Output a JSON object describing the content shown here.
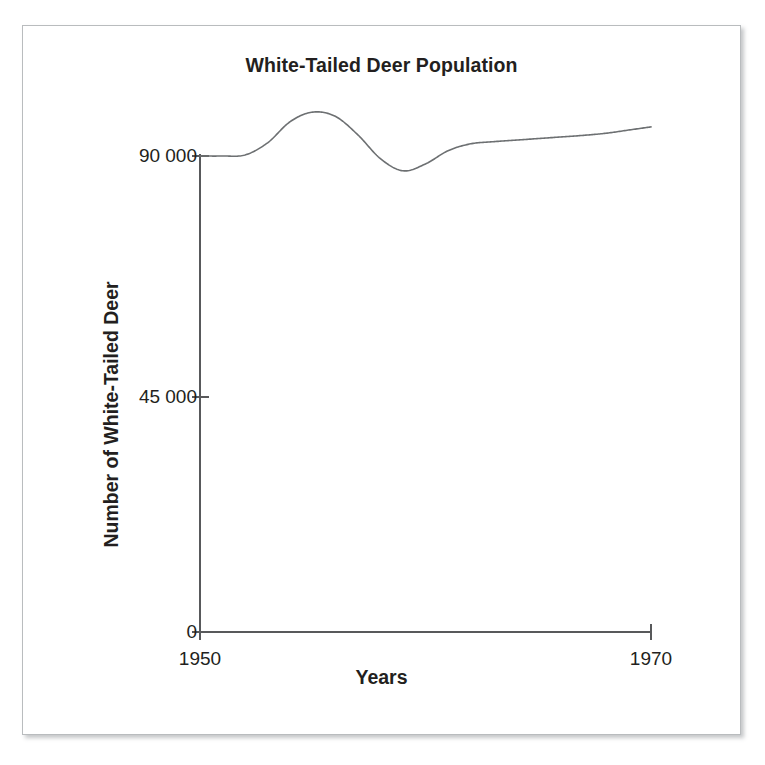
{
  "figure": {
    "frame_color": "#b9bcbe",
    "background": "#ffffff"
  },
  "chart_data": {
    "type": "line",
    "title": "White-Tailed Deer Population",
    "xlabel": "Years",
    "ylabel": "Number of White-Tailed Deer",
    "x": [
      1950,
      1951,
      1952,
      1953,
      1954,
      1955,
      1956,
      1957,
      1958,
      1959,
      1960,
      1961,
      1962,
      1963,
      1964,
      1965,
      1966,
      1967,
      1968,
      1969,
      1970
    ],
    "values": [
      90000,
      90000,
      90200,
      92500,
      96500,
      98300,
      97500,
      94000,
      89500,
      87200,
      88500,
      91000,
      92300,
      92700,
      93000,
      93300,
      93600,
      93900,
      94300,
      94900,
      95500
    ],
    "series": [
      {
        "name": "White-Tailed Deer Population",
        "values": [
          90000,
          90000,
          90200,
          92500,
          96500,
          98300,
          97500,
          94000,
          89500,
          87200,
          88500,
          91000,
          92300,
          92700,
          93000,
          93300,
          93600,
          93900,
          94300,
          94900,
          95500
        ]
      }
    ],
    "xlim": [
      1950,
      1970
    ],
    "ylim": [
      0,
      112500
    ],
    "x_ticks": [
      1950,
      1970
    ],
    "x_tick_labels": [
      "1950",
      "1970"
    ],
    "y_ticks": [
      0,
      45000,
      90000
    ],
    "y_tick_labels": [
      "0",
      "45 000",
      "90 000"
    ],
    "grid": false,
    "legend": false,
    "line_color": "#6d7072",
    "line_width": 1.6,
    "axis_color": "#58595b"
  },
  "axis_labels": {
    "y_90000": "90 000",
    "y_45000": "45 000",
    "y_0": "0",
    "x_start": "1950",
    "x_end": "1970"
  }
}
